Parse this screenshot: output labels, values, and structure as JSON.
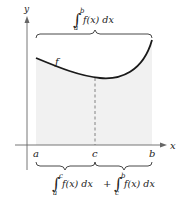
{
  "diagram": {
    "axes": {
      "x_label": "x",
      "y_label": "y"
    },
    "curve_label": "f",
    "points": {
      "a": "a",
      "c": "c",
      "b": "b"
    },
    "top_integral": {
      "symbol": "∫",
      "lower": "a",
      "upper": "b",
      "integrand": "f(x) dx"
    },
    "bottom_integral": {
      "left": {
        "symbol": "∫",
        "lower": "a",
        "upper": "c",
        "integrand": "f(x) dx"
      },
      "operator": "+",
      "right": {
        "symbol": "∫",
        "lower": "c",
        "upper": "b",
        "integrand": "f(x) dx"
      }
    },
    "colors": {
      "shade": "#f1f1f1",
      "curve": "#1a1a1a",
      "axis": "#555555",
      "dash": "#777777"
    }
  }
}
